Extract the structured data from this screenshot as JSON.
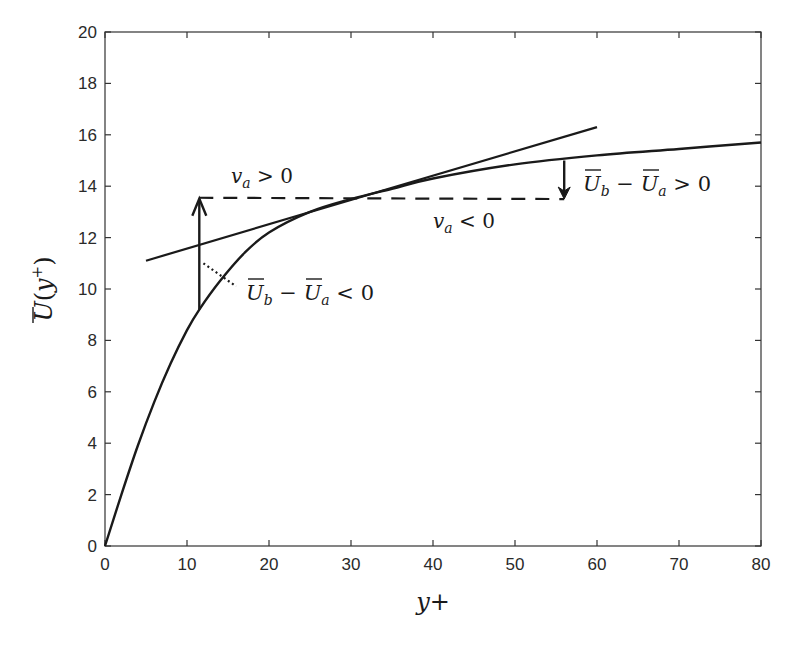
{
  "chart_data": {
    "type": "line",
    "title": "",
    "xlabel": "y+",
    "ylabel": "Ū(y⁺)",
    "xlim": [
      0,
      80
    ],
    "ylim": [
      0,
      20
    ],
    "grid": false,
    "x_ticks": [
      "0",
      "10",
      "20",
      "30",
      "40",
      "50",
      "60",
      "70",
      "80"
    ],
    "y_ticks": [
      "0",
      "2",
      "4",
      "6",
      "8",
      "10",
      "12",
      "14",
      "16",
      "18",
      "20"
    ],
    "series": [
      {
        "name": "mean velocity profile",
        "style": "solid",
        "x": [
          0,
          2,
          4,
          6,
          8,
          10,
          11.5,
          14,
          17,
          20,
          25,
          30,
          35,
          40,
          50,
          60,
          70,
          80
        ],
        "y": [
          0,
          2.0,
          3.9,
          5.6,
          7.1,
          8.4,
          9.2,
          10.3,
          11.4,
          12.2,
          13.0,
          13.5,
          13.9,
          14.3,
          14.85,
          15.2,
          15.45,
          15.7
        ]
      },
      {
        "name": "tangent line",
        "style": "solid",
        "x": [
          5,
          60
        ],
        "y": [
          11.1,
          16.3
        ]
      },
      {
        "name": "reference level",
        "style": "dashed",
        "x": [
          11.5,
          56
        ],
        "y": [
          13.55,
          13.5
        ]
      },
      {
        "name": "dotted connector",
        "style": "dotted",
        "x": [
          12,
          16
        ],
        "y": [
          11.0,
          10.1
        ]
      }
    ],
    "annotations": [
      {
        "text": "v_a > 0",
        "x": 15.5,
        "y": 14.3
      },
      {
        "text": "v_a < 0",
        "x": 40.5,
        "y": 12.6
      },
      {
        "text": "Ū_b − Ū_a > 0",
        "x": 58.5,
        "y": 14.3
      },
      {
        "text": "Ū_b − Ū_a < 0",
        "x": 17,
        "y": 9.8
      },
      {
        "text": "up arrow",
        "x": 11.5,
        "y_from": 9.2,
        "y_to": 13.55
      },
      {
        "text": "down arrow",
        "x": 56,
        "y_from": 15.0,
        "y_to": 13.5
      }
    ]
  },
  "labels": {
    "xlabel": "y+",
    "ylabel_base": "U",
    "ylabel_open": "(",
    "ylabel_var": "y",
    "ylabel_sup": "+",
    "ylabel_close": ")",
    "ann_va_pos": "v",
    "ann_va_pos_sub": "a",
    "ann_va_pos_rel": " > 0",
    "ann_va_neg": "v",
    "ann_va_neg_sub": "a",
    "ann_va_neg_rel": " < 0",
    "ann_u_pos_b": "U",
    "ann_u_pos_bsub": "b",
    "ann_u_pos_minus": " − ",
    "ann_u_pos_a": "U",
    "ann_u_pos_asub": "a",
    "ann_u_pos_rel": " > 0",
    "ann_u_neg_b": "U",
    "ann_u_neg_bsub": "b",
    "ann_u_neg_minus": " − ",
    "ann_u_neg_a": "U",
    "ann_u_neg_asub": "a",
    "ann_u_neg_rel": " < 0"
  },
  "colors": {
    "ink": "#1a1a1a",
    "axis": "#333333",
    "background": "#ffffff"
  }
}
